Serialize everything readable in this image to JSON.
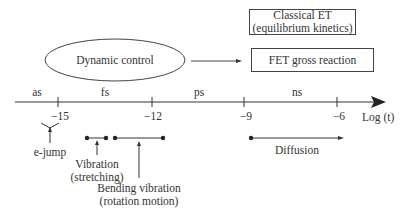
{
  "diagram": {
    "ellipse": {
      "label": "Dynamic control"
    },
    "boxes": {
      "classical_et": {
        "line1": "Classical ET",
        "line2": "(equilibrium kinetics)"
      },
      "fet": {
        "label": "FET gross reaction"
      }
    },
    "axis": {
      "label": "Log (t)",
      "ticks": [
        "−15",
        "−12",
        "−9",
        "−6"
      ],
      "units": [
        "as",
        "fs",
        "ps",
        "ns"
      ]
    },
    "processes": {
      "e_jump": "e-jump",
      "vibration": {
        "line1": "Vibration",
        "line2": "(stretching)"
      },
      "bending": {
        "line1": "Bending vibration",
        "line2": "(rotation motion)"
      },
      "diffusion": "Diffusion"
    },
    "colors": {
      "line": "#333333",
      "background": "#ffffff"
    }
  }
}
